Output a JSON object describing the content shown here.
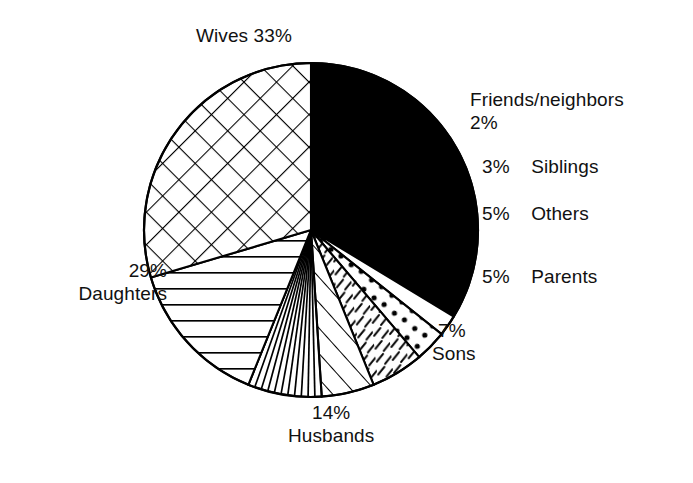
{
  "chart_data": {
    "type": "pie",
    "title": "",
    "subtitle": "",
    "xlabel": "",
    "ylabel": "",
    "legend_position": "none",
    "grid": false,
    "units": "percent",
    "total": 98,
    "start_angle_deg": 0,
    "direction": "clockwise",
    "categories": [
      "Wives",
      "Friends/neighbors",
      "Siblings",
      "Others",
      "Parents",
      "Sons",
      "Husbands",
      "Daughters"
    ],
    "values": [
      33,
      2,
      3,
      5,
      5,
      7,
      14,
      29
    ],
    "slices": [
      {
        "name": "Wives",
        "label": "Wives",
        "percent": 33,
        "percent_text": "33%",
        "fill": "solid-black",
        "color": "#000000"
      },
      {
        "name": "Friends/neighbors",
        "label": "Friends/neighbors",
        "percent": 2,
        "percent_text": "2%",
        "fill": "blank-white",
        "color": "#ffffff"
      },
      {
        "name": "Siblings",
        "label": "Siblings",
        "percent": 3,
        "percent_text": "3%",
        "fill": "dots",
        "color": "#ffffff"
      },
      {
        "name": "Others",
        "label": "Others",
        "percent": 5,
        "percent_text": "5%",
        "fill": "short-dashes",
        "color": "#ffffff"
      },
      {
        "name": "Parents",
        "label": "Parents",
        "percent": 5,
        "percent_text": "5%",
        "fill": "diagonal-stripes",
        "color": "#ffffff"
      },
      {
        "name": "Sons",
        "label": "Sons",
        "percent": 7,
        "percent_text": "7%",
        "fill": "radial-fan-lines",
        "color": "#ffffff"
      },
      {
        "name": "Husbands",
        "label": "Husbands",
        "percent": 14,
        "percent_text": "14%",
        "fill": "horizontal-lines",
        "color": "#ffffff"
      },
      {
        "name": "Daughters",
        "label": "Daughters",
        "percent": 29,
        "percent_text": "29%",
        "fill": "diamond-crosshatch",
        "color": "#ffffff"
      }
    ]
  },
  "labels": {
    "wives": {
      "name": "Wives",
      "percent": "33%",
      "combined": "Wives  33%"
    },
    "friends": {
      "name": "Friends/neighbors",
      "percent": "2%"
    },
    "siblings": {
      "name": "Siblings",
      "percent": "3%"
    },
    "others": {
      "name": "Others",
      "percent": "5%"
    },
    "parents": {
      "name": "Parents",
      "percent": "5%"
    },
    "sons": {
      "name": "Sons",
      "percent": "7%"
    },
    "husbands": {
      "name": "Husbands",
      "percent": "14%"
    },
    "daughters": {
      "name": "Daughters",
      "percent": "29%"
    }
  },
  "style": {
    "background": "#ffffff",
    "ink": "#000000",
    "stroke_width": "1.6"
  }
}
